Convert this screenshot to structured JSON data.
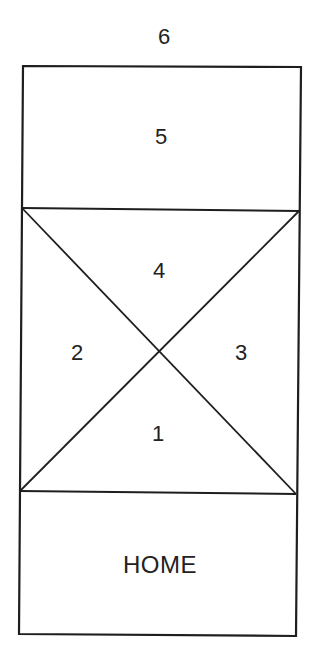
{
  "diagram": {
    "stroke_color": "#1e1e1e",
    "background": "#ffffff",
    "outer_label": "6",
    "regions": [
      {
        "id": "zone-5",
        "label": "5",
        "shape": "rectangle (top)"
      },
      {
        "id": "zone-4",
        "label": "4",
        "shape": "triangle (top of X)"
      },
      {
        "id": "zone-2",
        "label": "2",
        "shape": "triangle (left of X)"
      },
      {
        "id": "zone-3",
        "label": "3",
        "shape": "triangle (right of X)"
      },
      {
        "id": "zone-1",
        "label": "1",
        "shape": "triangle (bottom of X)"
      },
      {
        "id": "zone-home",
        "label": "HOME",
        "shape": "rectangle (bottom)"
      }
    ]
  },
  "labels": {
    "six": "6",
    "five": "5",
    "four": "4",
    "two": "2",
    "three": "3",
    "one": "1",
    "home": "HOME"
  }
}
